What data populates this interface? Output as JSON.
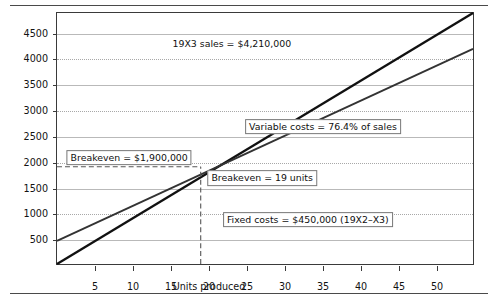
{
  "figure": {
    "name": "breakeven-analysis-chart"
  },
  "chart_data": {
    "type": "line",
    "title": "",
    "xlabel": "Units produced",
    "ylabel": "Dollar volume (thousands)",
    "xlim": [
      0,
      55
    ],
    "ylim": [
      0,
      4900
    ],
    "xticks": [
      5,
      10,
      15,
      20,
      25,
      30,
      35,
      40,
      45,
      50
    ],
    "yticks": [
      500,
      1000,
      1500,
      2000,
      2500,
      3000,
      3500,
      4000,
      4500
    ],
    "grid": "horizontal-alternating-solid-dotted",
    "legend": "none",
    "series": [
      {
        "name": "Sales",
        "points": [
          [
            0,
            0
          ],
          [
            55,
            4900
          ]
        ],
        "color": "#111111",
        "style": "solid"
      },
      {
        "name": "Variable costs plus fixed costs",
        "points": [
          [
            0,
            450
          ],
          [
            55,
            4200
          ]
        ],
        "color": "#333333",
        "style": "solid"
      }
    ],
    "reference_lines": [
      {
        "name": "breakeven-horizontal",
        "orientation": "horizontal",
        "value": 1900,
        "style": "dashed",
        "from_x": 0,
        "to_x": 19
      },
      {
        "name": "breakeven-vertical",
        "orientation": "vertical",
        "value": 19,
        "style": "dashed",
        "from_y": 0,
        "to_y": 1900
      }
    ],
    "annotations": [
      {
        "name": "sales-annotation",
        "text": "19X3 sales = $4,210,000",
        "x": 23,
        "y": 4300,
        "boxed": false
      },
      {
        "name": "variable-costs-annotation",
        "text": "Variable costs = 76.4% of sales",
        "x": 35,
        "y": 2700,
        "boxed": true
      },
      {
        "name": "breakeven-dollar-annotation",
        "text": "Breakeven = $1,900,000",
        "x": 9.5,
        "y": 2100,
        "boxed": true
      },
      {
        "name": "breakeven-units-annotation",
        "text": "Breakeven = 19 units",
        "x": 27,
        "y": 1700,
        "boxed": true
      },
      {
        "name": "fixed-costs-annotation",
        "text": "Fixed costs = $450,000 (19X2–X3)",
        "x": 33,
        "y": 900,
        "boxed": true
      }
    ]
  },
  "axis": {
    "y_title": "Dollar volume (thousands)",
    "x_title": "Units produced",
    "y_labels": [
      "4500",
      "4000",
      "3500",
      "3000",
      "2500",
      "2000",
      "1500",
      "1000",
      "500"
    ],
    "x_labels": [
      "5",
      "10",
      "15",
      "20",
      "25",
      "30",
      "35",
      "40",
      "45",
      "50"
    ]
  },
  "annotations_text": {
    "sales": "19X3 sales = $4,210,000",
    "variable_costs": "Variable costs = 76.4% of sales",
    "breakeven_dollars": "Breakeven = $1,900,000",
    "breakeven_units": "Breakeven = 19 units",
    "fixed_costs": "Fixed costs = $450,000 (19X2–X3)"
  },
  "colors": {
    "sales_line": "#111111",
    "cost_line": "#333333",
    "grid_solid": "#b9b9b9",
    "grid_dotted": "#a8a8a8",
    "frame": "#3a3a3a",
    "rule": "#4a4a4a"
  }
}
